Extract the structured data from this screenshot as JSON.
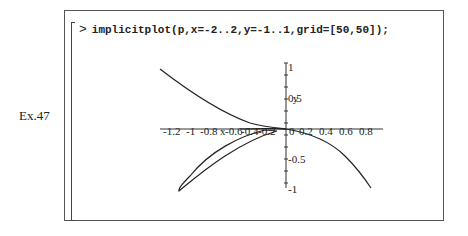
{
  "example_label": "Ex.47",
  "worksheet": {
    "prompt_symbol": ">",
    "command": "implicitplot(p,x=-2..2,y=-1..1,grid=[50,50]);"
  },
  "plot": {
    "x_ticks": [
      "-1.2",
      "-1",
      "-0.8",
      "-0.6",
      "-0.4",
      "-0.2",
      "0",
      "0.2",
      "0.4",
      "0.6",
      "0.8"
    ],
    "y_ticks": [
      "1",
      "0.5",
      "-0.5",
      "-1"
    ],
    "x_axis_label": "x",
    "y_axis_label": "y"
  }
}
